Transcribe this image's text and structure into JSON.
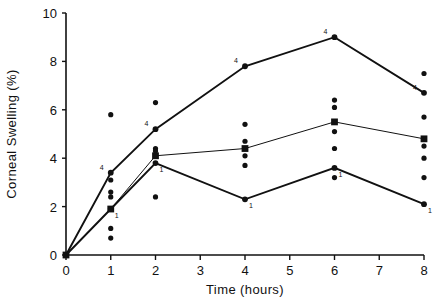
{
  "chart_data": {
    "type": "line",
    "title": "",
    "subtitle": "",
    "xlabel": "Time  (hours)",
    "ylabel": "Corneal  Swelling  (%)",
    "xlim": [
      0,
      8
    ],
    "ylim": [
      0,
      10
    ],
    "xticks": [
      0,
      1,
      2,
      3,
      4,
      5,
      6,
      7,
      8
    ],
    "xtick_labels": [
      "0",
      "1",
      "2",
      "3",
      "4",
      "5",
      "6",
      "7",
      "8"
    ],
    "yticks": [
      0,
      2,
      4,
      6,
      8,
      10
    ],
    "ytick_labels": [
      "0",
      "2",
      "4",
      "6",
      "8",
      "10"
    ],
    "grid": false,
    "legend": "none",
    "x": [
      0,
      1,
      2,
      4,
      6,
      8
    ],
    "series": [
      {
        "name": "upper",
        "marker": "circle",
        "point_label": "4",
        "values": [
          0,
          3.4,
          5.2,
          7.8,
          9.0,
          6.7
        ],
        "labels": [
          "",
          "4",
          "4",
          "4",
          "4",
          "4"
        ]
      },
      {
        "name": "mean",
        "marker": "square",
        "point_label": "",
        "values": [
          0,
          1.9,
          4.1,
          4.4,
          5.5,
          4.8
        ],
        "labels": [
          "",
          "",
          "",
          "",
          "",
          ""
        ]
      },
      {
        "name": "lower",
        "marker": "circle",
        "point_label": "1",
        "values": [
          0,
          1.9,
          3.8,
          2.3,
          3.6,
          2.1
        ],
        "labels": [
          "",
          "1",
          "1",
          "1",
          "1",
          "1"
        ]
      }
    ],
    "scatter": [
      {
        "x": 1,
        "y": 5.8
      },
      {
        "x": 1,
        "y": 3.1
      },
      {
        "x": 1,
        "y": 2.6
      },
      {
        "x": 1,
        "y": 2.4
      },
      {
        "x": 1,
        "y": 1.1
      },
      {
        "x": 1,
        "y": 0.7
      },
      {
        "x": 2,
        "y": 6.3
      },
      {
        "x": 2,
        "y": 4.4
      },
      {
        "x": 2,
        "y": 4.3
      },
      {
        "x": 2,
        "y": 2.4
      },
      {
        "x": 4,
        "y": 5.4
      },
      {
        "x": 4,
        "y": 4.7
      },
      {
        "x": 4,
        "y": 4.1
      },
      {
        "x": 4,
        "y": 3.7
      },
      {
        "x": 6,
        "y": 6.4
      },
      {
        "x": 6,
        "y": 6.1
      },
      {
        "x": 6,
        "y": 5.1
      },
      {
        "x": 6,
        "y": 4.4
      },
      {
        "x": 6,
        "y": 3.2
      },
      {
        "x": 8,
        "y": 7.5
      },
      {
        "x": 8,
        "y": 5.7
      },
      {
        "x": 8,
        "y": 4.5
      },
      {
        "x": 8,
        "y": 4.0
      },
      {
        "x": 8,
        "y": 3.2
      }
    ]
  },
  "colors": {
    "ink": "#111111",
    "background": "#ffffff"
  }
}
